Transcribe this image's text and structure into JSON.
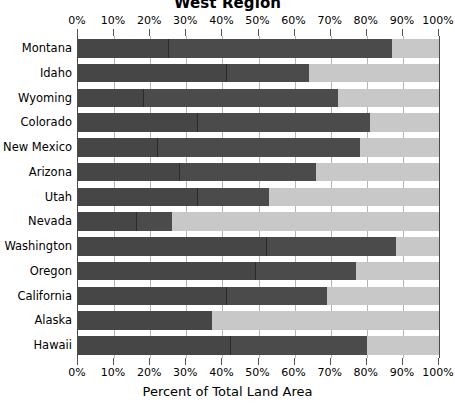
{
  "chart_data": {
    "type": "bar",
    "orientation": "horizontal",
    "stacked": true,
    "title": "West Region",
    "subtitle": "",
    "xlabel": "Percent of Total Land Area",
    "ylabel": "",
    "xlim": [
      0,
      100
    ],
    "grid": true,
    "legend_position": "none",
    "tick_labels": [
      "0%",
      "10%",
      "20%",
      "30%",
      "40%",
      "50%",
      "60%",
      "70%",
      "80%",
      "90%",
      "100%"
    ],
    "tick_values": [
      0,
      10,
      20,
      30,
      40,
      50,
      60,
      70,
      80,
      90,
      100
    ],
    "categories": [
      "Montana",
      "Idaho",
      "Wyoming",
      "Colorado",
      "New Mexico",
      "Arizona",
      "Utah",
      "Nevada",
      "Washington",
      "Oregon",
      "California",
      "Alaska",
      "Hawaii"
    ],
    "series": [
      {
        "name": "Segment 1",
        "color": "#464646",
        "values": [
          25,
          41,
          18,
          33,
          22,
          28,
          33,
          16,
          52,
          49,
          41,
          37,
          42
        ]
      },
      {
        "name": "Segment 2",
        "color": "#4b4b4b",
        "values": [
          62,
          23,
          54,
          48,
          56,
          38,
          20,
          10,
          36,
          28,
          28,
          0,
          38
        ]
      },
      {
        "name": "Segment 3",
        "color": "#c8c8c8",
        "values": [
          13,
          36,
          28,
          19,
          22,
          34,
          47,
          74,
          12,
          23,
          31,
          63,
          20
        ]
      }
    ],
    "totals_dark": [
      87,
      64,
      72,
      81,
      78,
      66,
      53,
      26,
      88,
      77,
      69,
      37,
      80
    ],
    "colors": {
      "segment_1": "#464646",
      "segment_2": "#4b4b4b",
      "segment_3": "#c8c8c8",
      "axis": "#4a4a4a",
      "gridline": "#b5b5b5",
      "text": "#000000",
      "background": "#ffffff"
    }
  }
}
